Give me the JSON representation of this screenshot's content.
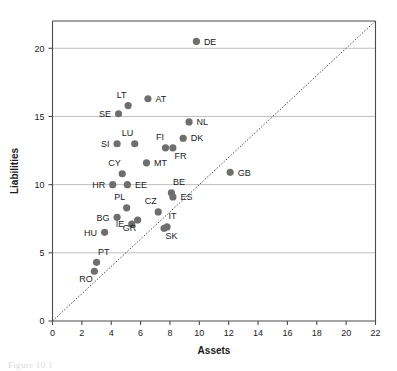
{
  "chart_data": {
    "type": "scatter",
    "title": "",
    "xlabel": "Assets",
    "ylabel": "Liabilities",
    "xlim": [
      0,
      22
    ],
    "ylim": [
      0,
      22
    ],
    "xticks": [
      0,
      2,
      4,
      6,
      8,
      10,
      12,
      14,
      16,
      18,
      20,
      22
    ],
    "yticks": [
      0,
      5,
      10,
      15,
      20
    ],
    "grid": "horizontal",
    "legend": "none",
    "reference_line": {
      "name": "identity-line",
      "style": "dotted",
      "from": [
        0,
        0
      ],
      "to": [
        22,
        22
      ]
    },
    "points": [
      {
        "label": "DE",
        "x": 9.8,
        "y": 20.5,
        "label_pos": "right"
      },
      {
        "label": "AT",
        "x": 6.5,
        "y": 16.3,
        "label_pos": "right"
      },
      {
        "label": "LT",
        "x": 5.15,
        "y": 15.8,
        "label_pos": "above-left"
      },
      {
        "label": "SE",
        "x": 4.5,
        "y": 15.2,
        "label_pos": "left"
      },
      {
        "label": "NL",
        "x": 9.3,
        "y": 14.6,
        "label_pos": "right"
      },
      {
        "label": "DK",
        "x": 8.9,
        "y": 13.4,
        "label_pos": "right"
      },
      {
        "label": "LU",
        "x": 5.6,
        "y": 13.0,
        "label_pos": "above-left"
      },
      {
        "label": "SI",
        "x": 4.4,
        "y": 13.0,
        "label_pos": "left"
      },
      {
        "label": "FI",
        "x": 7.7,
        "y": 12.7,
        "label_pos": "above-left"
      },
      {
        "label": "FR",
        "x": 8.2,
        "y": 12.7,
        "label_pos": "below-right"
      },
      {
        "label": "MT",
        "x": 6.4,
        "y": 11.6,
        "label_pos": "right"
      },
      {
        "label": "GB",
        "x": 12.1,
        "y": 10.9,
        "label_pos": "right"
      },
      {
        "label": "CY",
        "x": 4.75,
        "y": 10.8,
        "label_pos": "above-left"
      },
      {
        "label": "HR",
        "x": 4.1,
        "y": 10.0,
        "label_pos": "left"
      },
      {
        "label": "EE",
        "x": 5.1,
        "y": 10.0,
        "label_pos": "right"
      },
      {
        "label": "BE",
        "x": 8.1,
        "y": 9.4,
        "label_pos": "above-right"
      },
      {
        "label": "ES",
        "x": 8.2,
        "y": 9.1,
        "label_pos": "right"
      },
      {
        "label": "PL",
        "x": 5.05,
        "y": 8.3,
        "label_pos": "above-left"
      },
      {
        "label": "CZ",
        "x": 7.2,
        "y": 8.0,
        "label_pos": "above-left"
      },
      {
        "label": "BG",
        "x": 4.4,
        "y": 7.6,
        "label_pos": "left"
      },
      {
        "label": "GR",
        "x": 5.8,
        "y": 7.4,
        "label_pos": "below-left"
      },
      {
        "label": "IE",
        "x": 5.4,
        "y": 7.1,
        "label_pos": "left"
      },
      {
        "label": "IT",
        "x": 7.8,
        "y": 6.9,
        "label_pos": "above-right"
      },
      {
        "label": "SK",
        "x": 7.6,
        "y": 6.8,
        "label_pos": "below-right"
      },
      {
        "label": "HU",
        "x": 3.55,
        "y": 6.5,
        "label_pos": "left"
      },
      {
        "label": "PT",
        "x": 3.0,
        "y": 4.3,
        "label_pos": "above-right"
      },
      {
        "label": "RO",
        "x": 2.85,
        "y": 3.65,
        "label_pos": "below-left"
      }
    ]
  },
  "colors": {
    "dot": "#6e6e6e",
    "grid": "#b8b8b8",
    "axis": "#4a4a4a",
    "text": "#1a1a1a",
    "background": "#ffffff"
  },
  "caption": {
    "text": "Figure 10.1"
  }
}
